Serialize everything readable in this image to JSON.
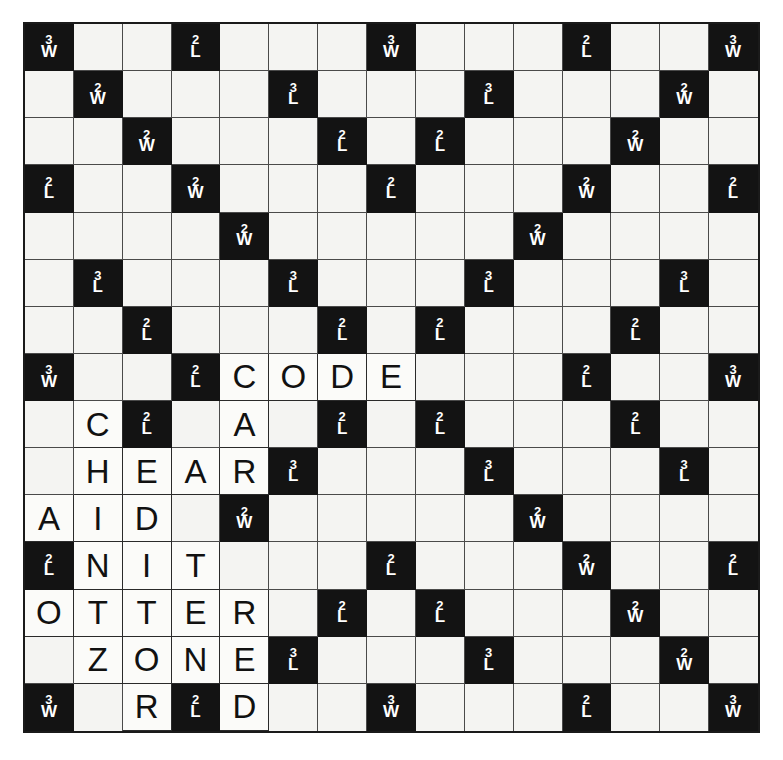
{
  "board": {
    "title": "Scrabble Board",
    "rows": 15,
    "cols": 15,
    "colors": {
      "premium_background": "#131313",
      "premium_text": "#ffffff",
      "empty_cell": "#f4f4f2",
      "tile_cell": "#fbfbf9",
      "tile_text": "#111111",
      "grid_line": "#4a4a4a",
      "border": "#1a1a1a",
      "page_background": "#ffffff"
    },
    "premium_legend": {
      "triple_word": {
        "mult": "3",
        "kind": "W"
      },
      "double_word": {
        "mult": "2",
        "kind": "W"
      },
      "triple_letter": {
        "mult": "3",
        "kind": "L"
      },
      "double_letter": {
        "mult": "2",
        "kind": "L"
      }
    },
    "cells": [
      [
        {
          "p": "TW"
        },
        {},
        {},
        {
          "p": "DL"
        },
        {},
        {},
        {},
        {
          "p": "TW"
        },
        {},
        {},
        {},
        {
          "p": "DL"
        },
        {},
        {},
        {
          "p": "TW"
        }
      ],
      [
        {},
        {
          "p": "DW"
        },
        {},
        {},
        {},
        {
          "p": "TL"
        },
        {},
        {},
        {},
        {
          "p": "TL"
        },
        {},
        {},
        {},
        {
          "p": "DW"
        },
        {}
      ],
      [
        {},
        {},
        {
          "p": "DW"
        },
        {},
        {},
        {},
        {
          "p": "DL"
        },
        {},
        {
          "p": "DL"
        },
        {},
        {},
        {},
        {
          "p": "DW"
        },
        {},
        {}
      ],
      [
        {
          "p": "DL"
        },
        {},
        {},
        {
          "p": "DW"
        },
        {},
        {},
        {},
        {
          "p": "DL"
        },
        {},
        {},
        {},
        {
          "p": "DW"
        },
        {},
        {},
        {
          "p": "DL"
        }
      ],
      [
        {},
        {},
        {},
        {},
        {
          "p": "DW"
        },
        {},
        {},
        {},
        {},
        {},
        {
          "p": "DW"
        },
        {},
        {},
        {},
        {}
      ],
      [
        {},
        {
          "p": "TL"
        },
        {},
        {},
        {},
        {
          "p": "TL"
        },
        {},
        {},
        {},
        {
          "p": "TL"
        },
        {},
        {},
        {},
        {
          "p": "TL"
        },
        {}
      ],
      [
        {},
        {},
        {
          "p": "DL"
        },
        {},
        {},
        {},
        {
          "p": "DL"
        },
        {},
        {
          "p": "DL"
        },
        {},
        {},
        {},
        {
          "p": "DL"
        },
        {},
        {}
      ],
      [
        {
          "p": "TW"
        },
        {},
        {},
        {
          "p": "DL"
        },
        {
          "t": "C"
        },
        {
          "t": "O"
        },
        {
          "t": "D"
        },
        {
          "t": "E"
        },
        {},
        {},
        {},
        {
          "p": "DL"
        },
        {},
        {},
        {
          "p": "TW"
        }
      ],
      [
        {},
        {
          "t": "C"
        },
        {
          "p": "DL"
        },
        {},
        {
          "t": "A"
        },
        {},
        {
          "p": "DL"
        },
        {},
        {
          "p": "DL"
        },
        {},
        {},
        {},
        {
          "p": "DL"
        },
        {},
        {}
      ],
      [
        {},
        {
          "t": "H"
        },
        {
          "t": "E"
        },
        {
          "t": "A"
        },
        {
          "t": "R"
        },
        {
          "p": "TL"
        },
        {},
        {},
        {},
        {
          "p": "TL"
        },
        {},
        {},
        {},
        {
          "p": "TL"
        },
        {}
      ],
      [
        {
          "t": "A"
        },
        {
          "t": "I"
        },
        {
          "t": "D"
        },
        {},
        {
          "p": "DW"
        },
        {},
        {},
        {},
        {},
        {},
        {
          "p": "DW"
        },
        {},
        {},
        {},
        {}
      ],
      [
        {
          "p": "DL"
        },
        {
          "t": "N"
        },
        {
          "t": "I"
        },
        {
          "t": "T"
        },
        {},
        {},
        {},
        {
          "p": "DL"
        },
        {},
        {},
        {},
        {
          "p": "DW"
        },
        {},
        {},
        {
          "p": "DL"
        }
      ],
      [
        {
          "t": "O"
        },
        {
          "t": "T"
        },
        {
          "t": "T"
        },
        {
          "t": "E"
        },
        {
          "t": "R"
        },
        {},
        {
          "p": "DL"
        },
        {},
        {
          "p": "DL"
        },
        {},
        {},
        {},
        {
          "p": "DW"
        },
        {},
        {}
      ],
      [
        {},
        {
          "t": "Z"
        },
        {
          "t": "O"
        },
        {
          "t": "N"
        },
        {
          "t": "E"
        },
        {
          "p": "TL"
        },
        {},
        {},
        {},
        {
          "p": "TL"
        },
        {},
        {},
        {},
        {
          "p": "DW"
        },
        {}
      ],
      [
        {
          "p": "TW"
        },
        {},
        {
          "t": "R"
        },
        {
          "p": "DL"
        },
        {
          "t": "D"
        },
        {},
        {},
        {
          "p": "TW"
        },
        {},
        {},
        {},
        {
          "p": "DL"
        },
        {},
        {},
        {
          "p": "TW"
        }
      ]
    ],
    "words_on_board": [
      {
        "word": "CODE",
        "row": 7,
        "col": 4,
        "direction": "across"
      },
      {
        "word": "HEAR",
        "row": 9,
        "col": 1,
        "direction": "across"
      },
      {
        "word": "AID",
        "row": 10,
        "col": 0,
        "direction": "across"
      },
      {
        "word": "NIT",
        "row": 11,
        "col": 1,
        "direction": "across"
      },
      {
        "word": "OTTER",
        "row": 12,
        "col": 0,
        "direction": "across"
      },
      {
        "word": "ZONE",
        "row": 13,
        "col": 1,
        "direction": "across"
      },
      {
        "word": "CHAINOTZ",
        "row": 8,
        "col": 1,
        "direction": "down"
      },
      {
        "word": "EATONER",
        "row": 9,
        "col": 2,
        "direction": "down"
      },
      {
        "word": "ARTTEN",
        "row": 9,
        "col": 3,
        "direction": "down"
      },
      {
        "word": "CARER",
        "row": 7,
        "col": 4,
        "direction": "down"
      }
    ]
  }
}
